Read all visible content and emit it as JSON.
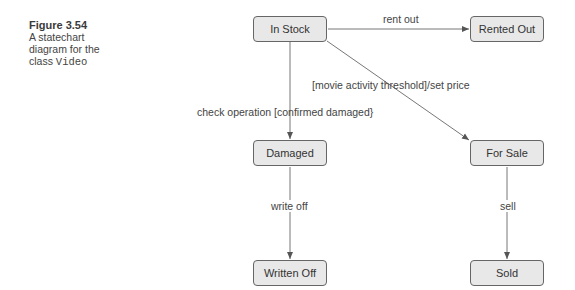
{
  "caption": {
    "figure": "Figure 3.54",
    "line1": "A statechart",
    "line2": "diagram for the",
    "line3_prefix": "class ",
    "line3_code": "Video"
  },
  "states": {
    "in_stock": "In Stock",
    "rented_out": "Rented Out",
    "damaged": "Damaged",
    "for_sale": "For Sale",
    "written_off": "Written Off",
    "sold": "Sold"
  },
  "transitions": {
    "rent_out": "rent out",
    "set_price": "[movie activity threshold]/set price",
    "check_operation": "check operation [confirmed damaged}",
    "write_off": "write off",
    "sell": "sell"
  }
}
